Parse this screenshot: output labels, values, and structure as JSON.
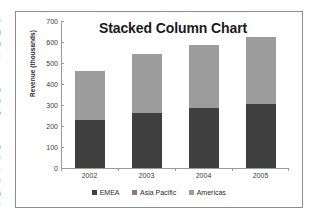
{
  "chart_data": {
    "type": "bar",
    "subtype": "stacked-column",
    "title": "Stacked Column Chart",
    "xlabel": "",
    "ylabel": "Revenue (thousands)",
    "categories": [
      "2002",
      "2003",
      "2004",
      "2005"
    ],
    "series": [
      {
        "name": "EMEA",
        "color": "#3f3f3f",
        "values": [
          230,
          263,
          287,
          307
        ]
      },
      {
        "name": "Asia Pacific",
        "color": "#7d7d7d",
        "values": [
          0,
          0,
          0,
          0
        ]
      },
      {
        "name": "Americas",
        "color": "#9c9c9c",
        "values": [
          230,
          282,
          298,
          318
        ]
      }
    ],
    "totals": [
      460,
      545,
      585,
      625
    ],
    "ylim": [
      0,
      700
    ],
    "yticks": [
      0,
      100,
      200,
      300,
      400,
      500,
      600,
      700
    ],
    "ytick_labels": [
      "0",
      "100",
      "200",
      "300",
      "400",
      "500",
      "600",
      "700"
    ],
    "grid": false,
    "legend_position": "bottom",
    "legend_entries": [
      "EMEA",
      "Asia Pacific",
      "Americas"
    ],
    "axis_color": "#9a9a9a",
    "frame_color": "#8c8c8c",
    "background": "#ffffff"
  },
  "scan_artifacts": {
    "left_margin_fragments": [
      "r",
      "e",
      "d",
      "u",
      "c",
      "t",
      "i",
      "o",
      "n",
      "o",
      "f",
      "t",
      "h",
      "e",
      "s",
      "e",
      "a",
      "s"
    ]
  }
}
